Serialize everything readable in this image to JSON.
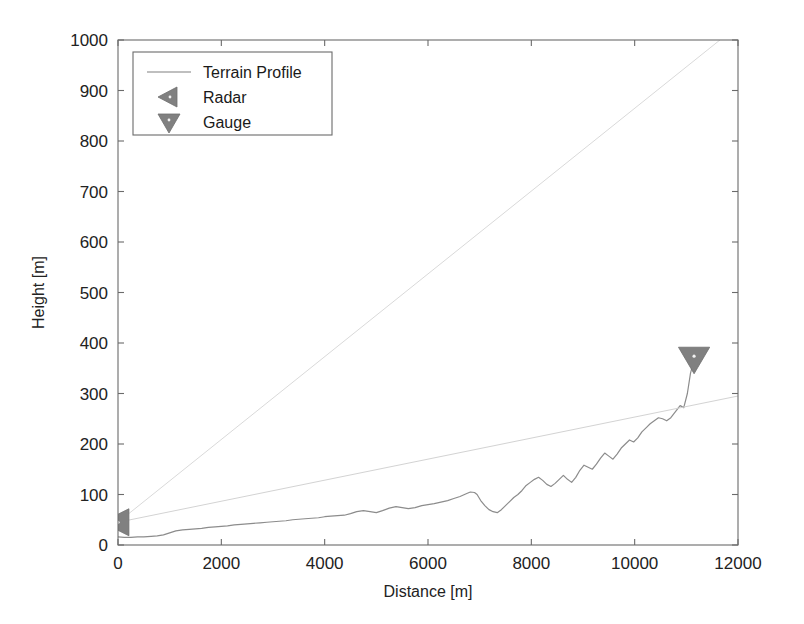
{
  "chart_data": {
    "type": "line",
    "title": "",
    "xlabel": "Distance [m]",
    "ylabel": "Height [m]",
    "xlim": [
      0,
      12000
    ],
    "ylim": [
      0,
      1000
    ],
    "xticks": [
      0,
      2000,
      4000,
      6000,
      8000,
      10000,
      12000
    ],
    "yticks": [
      0,
      100,
      200,
      300,
      400,
      500,
      600,
      700,
      800,
      900,
      1000
    ],
    "xtick_labels": [
      "0",
      "2000",
      "4000",
      "6000",
      "8000",
      "10000",
      "12000"
    ],
    "ytick_labels": [
      "0",
      "100",
      "200",
      "300",
      "400",
      "500",
      "600",
      "700",
      "800",
      "900",
      "1000"
    ],
    "grid": false,
    "legend_position": "upper left",
    "legend_entries": [
      {
        "label": "Terrain Profile",
        "marker": "line",
        "color": "#808080"
      },
      {
        "label": "Radar",
        "marker": "triangle-left",
        "color": "#808080"
      },
      {
        "label": "Gauge",
        "marker": "triangle-down",
        "color": "#808080"
      }
    ],
    "series": [
      {
        "name": "Terrain Profile",
        "type": "line",
        "color": "#8c8c8c",
        "x": [
          0,
          120,
          250,
          380,
          500,
          640,
          760,
          880,
          1000,
          1120,
          1250,
          1380,
          1500,
          1620,
          1750,
          1880,
          2000,
          2120,
          2250,
          2380,
          2500,
          2620,
          2750,
          2880,
          3000,
          3120,
          3250,
          3380,
          3500,
          3620,
          3750,
          3880,
          4000,
          4120,
          4250,
          4380,
          4500,
          4620,
          4750,
          4880,
          5000,
          5120,
          5250,
          5380,
          5500,
          5620,
          5750,
          5880,
          6000,
          6120,
          6250,
          6380,
          6500,
          6620,
          6750,
          6820,
          6900,
          6950,
          7020,
          7100,
          7180,
          7260,
          7340,
          7420,
          7500,
          7580,
          7660,
          7740,
          7820,
          7900,
          7980,
          8060,
          8140,
          8220,
          8300,
          8380,
          8460,
          8540,
          8620,
          8700,
          8780,
          8860,
          8940,
          9020,
          9100,
          9180,
          9260,
          9340,
          9420,
          9500,
          9580,
          9660,
          9740,
          9820,
          9900,
          9980,
          10060,
          10140,
          10220,
          10300,
          10380,
          10460,
          10540,
          10620,
          10700,
          10760,
          10820,
          10880,
          10950,
          11020,
          11080,
          11150
        ],
        "y": [
          16,
          15,
          15,
          16,
          16,
          17,
          18,
          20,
          24,
          28,
          30,
          31,
          32,
          33,
          35,
          36,
          37,
          38,
          40,
          41,
          42,
          43,
          44,
          45,
          46,
          47,
          48,
          50,
          51,
          52,
          53,
          54,
          56,
          57,
          58,
          59,
          62,
          66,
          68,
          66,
          64,
          68,
          73,
          76,
          74,
          72,
          74,
          78,
          80,
          82,
          85,
          88,
          92,
          96,
          102,
          105,
          104,
          100,
          88,
          78,
          70,
          66,
          64,
          70,
          78,
          86,
          94,
          100,
          108,
          118,
          124,
          130,
          134,
          128,
          120,
          116,
          122,
          130,
          138,
          130,
          124,
          134,
          148,
          158,
          154,
          150,
          160,
          172,
          182,
          176,
          170,
          180,
          192,
          200,
          208,
          204,
          212,
          224,
          232,
          240,
          246,
          252,
          250,
          246,
          252,
          260,
          268,
          276,
          272,
          300,
          340,
          368
        ]
      },
      {
        "name": "Radar Beam Upper",
        "type": "line",
        "color": "#d9d9d9",
        "x": [
          0,
          11650
        ],
        "y": [
          45,
          1000
        ]
      },
      {
        "name": "Radar Beam Lower",
        "type": "line",
        "color": "#d3d3d3",
        "x": [
          0,
          12000
        ],
        "y": [
          45,
          295
        ]
      }
    ],
    "markers": [
      {
        "name": "Radar",
        "x": 0,
        "y": 45,
        "shape": "triangle-left",
        "color": "#808080",
        "size": 26
      },
      {
        "name": "Gauge",
        "x": 11150,
        "y": 370,
        "shape": "triangle-down",
        "color": "#808080",
        "size": 26
      }
    ]
  }
}
